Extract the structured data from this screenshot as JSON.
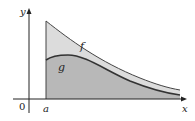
{
  "diagram": {
    "axes": {
      "x_label": "x",
      "y_label": "y",
      "origin_label": "0",
      "a_label": "a"
    },
    "curves": [
      {
        "name": "f",
        "label": "f",
        "description": "upper decreasing curve starting high at x=a"
      },
      {
        "name": "g",
        "label": "g",
        "description": "lower curve rising slightly then decreasing"
      }
    ],
    "colors": {
      "axis": "#222222",
      "curve": "#3a3a3a",
      "region_between": "#dcdcdc",
      "region_under_g": "#b8b8b8"
    }
  }
}
